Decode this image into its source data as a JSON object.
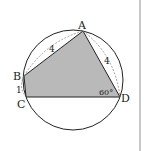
{
  "figure": {
    "type": "cyclic-quadrilateral",
    "circle": {
      "cx": 73,
      "cy": 80,
      "r": 50
    },
    "points": {
      "A": {
        "label": "A",
        "x": 83,
        "y": 31
      },
      "B": {
        "label": "B",
        "x": 24,
        "y": 76
      },
      "C": {
        "label": "C",
        "x": 26,
        "y": 97
      },
      "D": {
        "label": "D",
        "x": 120,
        "y": 97
      }
    },
    "edges": {
      "AB": {
        "label": "4"
      },
      "AD": {
        "label": "4"
      },
      "BC": {
        "label": "1"
      }
    },
    "angles": {
      "D": {
        "label": "60°"
      }
    },
    "colors": {
      "fill": "#b9b9b9",
      "stroke": "#222222",
      "dashed": "#888888",
      "divider": "#c8c8c8"
    }
  }
}
